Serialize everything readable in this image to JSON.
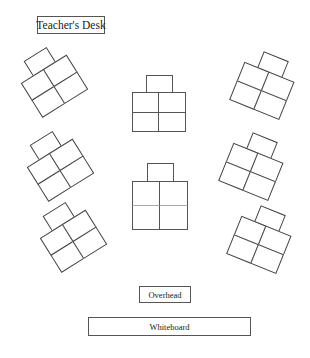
{
  "diagram": {
    "labels": {
      "teacher_desk": "Teacher's Desk",
      "overhead": "Overhead",
      "whiteboard": "Whiteboard"
    },
    "colors": {
      "background": "#ffffff",
      "stroke": "#555555",
      "text": "#222222"
    },
    "desk_groups": [
      {
        "id": "left-1",
        "desks": 5,
        "cx": 50,
        "cy": 79,
        "rotation": -32
      },
      {
        "id": "left-2",
        "desks": 5,
        "cx": 56,
        "cy": 163,
        "rotation": -32
      },
      {
        "id": "left-3",
        "desks": 5,
        "cx": 69,
        "cy": 234,
        "rotation": -32
      },
      {
        "id": "center-1",
        "desks": 5,
        "cx": 159,
        "cy": 104,
        "rotation": 0
      },
      {
        "id": "center-2",
        "desks": 5,
        "cx": 160,
        "cy": 197,
        "rotation": 0
      },
      {
        "id": "right-1",
        "desks": 5,
        "cx": 265,
        "cy": 83,
        "rotation": 22
      },
      {
        "id": "right-2",
        "desks": 5,
        "cx": 254,
        "cy": 164,
        "rotation": 22
      },
      {
        "id": "right-3",
        "desks": 5,
        "cx": 262,
        "cy": 237,
        "rotation": 22
      }
    ]
  }
}
